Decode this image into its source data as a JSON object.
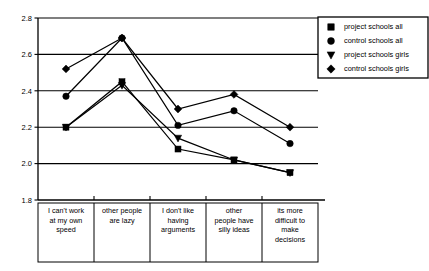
{
  "chart_data": {
    "type": "line",
    "title": "",
    "subtitle": "",
    "xlabel": "",
    "ylabel": "",
    "ylim": [
      1.8,
      2.8
    ],
    "yticks": [
      "1.8",
      "2.0",
      "2.2",
      "2.4",
      "2.6",
      "2.8"
    ],
    "ytick_values": [
      1.8,
      2.0,
      2.2,
      2.4,
      2.6,
      2.8
    ],
    "grid": "horizontal",
    "legend_position": "top-right",
    "categories": [
      "I can't work at my own speed",
      "other people are lazy",
      "I don't like having arguments",
      "other people have silly ideas",
      "its more difficult to make decisions"
    ],
    "category_lines": [
      [
        "I can't work",
        "at my own",
        "speed"
      ],
      [
        "other people",
        "are lazy"
      ],
      [
        "I don't like",
        "having",
        "arguments"
      ],
      [
        "other",
        "people have",
        "silly ideas"
      ],
      [
        "its more",
        "difficult to",
        "make",
        "decisions"
      ]
    ],
    "series": [
      {
        "name": "project schools all",
        "marker": "square",
        "values": [
          2.2,
          2.45,
          2.08,
          2.02,
          1.95
        ]
      },
      {
        "name": "control schools all",
        "marker": "circle",
        "values": [
          2.37,
          2.69,
          2.21,
          2.29,
          2.11
        ]
      },
      {
        "name": "project schools girls",
        "marker": "triangle-down",
        "values": [
          2.2,
          2.43,
          2.14,
          2.02,
          1.95
        ]
      },
      {
        "name": "control schools girls",
        "marker": "diamond",
        "values": [
          2.52,
          2.69,
          2.3,
          2.38,
          2.2
        ]
      }
    ],
    "colors": {
      "series": "#000000",
      "axis": "#000000",
      "grid": "#000000",
      "background": "#ffffff"
    }
  },
  "legend": {
    "entries": [
      {
        "label": "project schools all",
        "marker": "square"
      },
      {
        "label": "control schools all",
        "marker": "circle"
      },
      {
        "label": "project schools girls",
        "marker": "triangle-down"
      },
      {
        "label": "control schools girls",
        "marker": "diamond"
      }
    ]
  }
}
